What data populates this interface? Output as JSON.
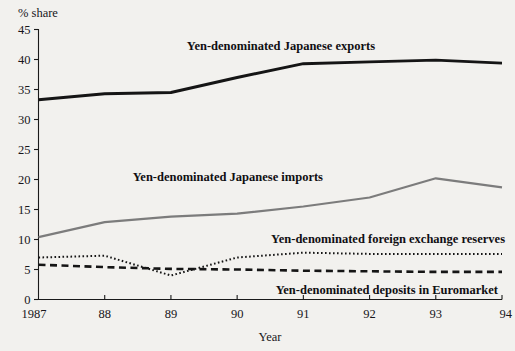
{
  "chart_data": {
    "type": "line",
    "title": "",
    "xlabel": "Year",
    "ylabel": "% share",
    "ylim": [
      0,
      45
    ],
    "xlim": [
      1987,
      1994
    ],
    "grid": false,
    "legend_position": "inline-annotations",
    "x": [
      1987,
      1988,
      1989,
      1990,
      1991,
      1992,
      1993,
      1994
    ],
    "x_tick_labels": [
      "1987",
      "88",
      "89",
      "90",
      "91",
      "92",
      "93",
      "94"
    ],
    "y_tick_labels": [
      "0",
      "5",
      "10",
      "15",
      "20",
      "25",
      "30",
      "35",
      "40",
      "45"
    ],
    "y_ticks": [
      0,
      5,
      10,
      15,
      20,
      25,
      30,
      35,
      40,
      45
    ],
    "series": [
      {
        "name": "Yen-denominated Japanese exports",
        "style": "solid-thick-black",
        "color": "#151515",
        "values": [
          33.3,
          34.3,
          34.5,
          37.0,
          39.3,
          39.6,
          39.9,
          39.4
        ]
      },
      {
        "name": "Yen-denominated Japanese imports",
        "style": "solid-gray",
        "color": "#7c7c7c",
        "values": [
          10.4,
          12.9,
          13.8,
          14.3,
          15.5,
          17.0,
          20.2,
          18.7
        ]
      },
      {
        "name": "Yen-denominated foreign exchange reserves",
        "style": "dotted",
        "color": "#151515",
        "values": [
          7.0,
          7.3,
          4.0,
          7.0,
          7.8,
          7.6,
          7.6,
          7.6
        ]
      },
      {
        "name": "Yen-denominated deposits in Euromarket",
        "style": "dashed",
        "color": "#151515",
        "values": [
          5.8,
          5.4,
          5.1,
          5.0,
          4.8,
          4.7,
          4.6,
          4.6
        ]
      }
    ],
    "annotations": [
      {
        "text": "Yen-denominated Japanese exports",
        "x": 375,
        "y": 50
      },
      {
        "text": "Yen-denominated Japanese imports",
        "x": 323,
        "y": 181
      },
      {
        "text": "Yen-denominated foreign exchange reserves",
        "x": 505,
        "y": 243
      },
      {
        "text": "Yen-denominated deposits in Euromarket",
        "x": 498,
        "y": 294
      }
    ]
  }
}
